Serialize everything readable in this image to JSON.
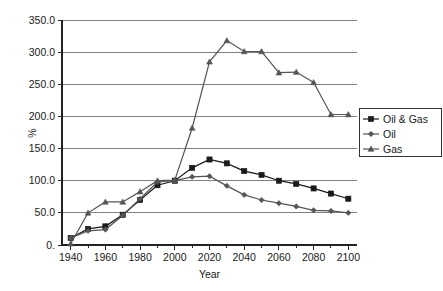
{
  "chart_data": {
    "type": "line",
    "title": "",
    "subtitle": "",
    "xlabel": "Year",
    "ylabel": "%",
    "xlim": [
      1935,
      2105
    ],
    "ylim": [
      0,
      350
    ],
    "grid": true,
    "grid_axis": "y",
    "legend_position": "right",
    "x_tick_labels": [
      "1940",
      "1960",
      "1980",
      "2000",
      "2020",
      "2040",
      "2060",
      "2080",
      "2100"
    ],
    "x_tick_values": [
      1940,
      1960,
      1980,
      2000,
      2020,
      2040,
      2060,
      2080,
      2100
    ],
    "x_minor_tick_values": [
      1950,
      1970,
      1990,
      2010,
      2030,
      2050,
      2070,
      2090
    ],
    "y_tick_labels": [
      "0.",
      "50.0",
      "100.0",
      "150.0",
      "200.0",
      "250.0",
      "300.0",
      "350.0"
    ],
    "y_tick_values": [
      0,
      50,
      100,
      150,
      200,
      250,
      300,
      350
    ],
    "x": [
      1940,
      1950,
      1960,
      1970,
      1980,
      1990,
      2000,
      2010,
      2020,
      2030,
      2040,
      2050,
      2060,
      2070,
      2080,
      2090,
      2100
    ],
    "series": [
      {
        "name": "Oil & Gas",
        "marker": "square",
        "color": "#1a1a1a",
        "values": [
          11,
          25,
          29,
          47,
          70,
          93,
          100,
          120,
          133,
          127,
          115,
          109,
          100,
          95,
          88,
          80,
          72
        ]
      },
      {
        "name": "Oil",
        "marker": "diamond",
        "color": "#555555",
        "values": [
          11,
          22,
          24,
          46,
          72,
          98,
          100,
          106,
          107,
          92,
          78,
          70,
          65,
          60,
          54,
          53,
          50
        ]
      },
      {
        "name": "Gas",
        "marker": "triangle",
        "color": "#555555",
        "values": [
          2,
          50,
          67,
          67,
          83,
          100,
          101,
          182,
          285,
          318,
          301,
          301,
          268,
          269,
          253,
          203,
          203
        ]
      }
    ],
    "legend_entries": [
      "Oil & Gas",
      "Oil",
      "Gas"
    ],
    "colors": {
      "oil_and_gas": "#1a1a1a",
      "oil": "#555555",
      "gas": "#555555",
      "gridline": "#808080",
      "axis": "#222222",
      "background": "#ffffff"
    }
  }
}
